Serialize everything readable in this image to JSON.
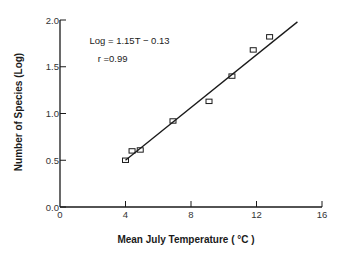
{
  "chart_data": {
    "type": "scatter",
    "title": "",
    "xlabel": "Mean July Temperature ( °C )",
    "ylabel": "Number of Species (Log)",
    "xlim": [
      0,
      16
    ],
    "ylim": [
      0.0,
      2.0
    ],
    "x_ticks": [
      0,
      4,
      8,
      12,
      16
    ],
    "x_tick_labels": [
      "0",
      "4",
      "8",
      "12",
      "16"
    ],
    "y_ticks": [
      0.0,
      0.5,
      1.0,
      1.5,
      2.0
    ],
    "y_tick_labels": [
      "0.0",
      "0.5",
      "1.0",
      "1.5",
      "2.0"
    ],
    "grid": false,
    "legend": null,
    "series": [
      {
        "name": "observations",
        "marker": "open-square",
        "points": [
          {
            "x": 4.0,
            "y": 0.5
          },
          {
            "x": 4.4,
            "y": 0.6
          },
          {
            "x": 4.9,
            "y": 0.61
          },
          {
            "x": 6.9,
            "y": 0.92
          },
          {
            "x": 9.1,
            "y": 1.13
          },
          {
            "x": 10.5,
            "y": 1.4
          },
          {
            "x": 11.8,
            "y": 1.68
          },
          {
            "x": 12.8,
            "y": 1.82
          }
        ]
      },
      {
        "name": "regression line",
        "type": "line",
        "points": [
          {
            "x": 4.0,
            "y": 0.5
          },
          {
            "x": 14.5,
            "y": 1.98
          }
        ]
      }
    ],
    "annotations": [
      {
        "text": "Log = 1.15T − 0.13",
        "x": 1.8,
        "y": 1.74
      },
      {
        "text": "r =0.99",
        "x": 2.3,
        "y": 1.55
      }
    ]
  },
  "colors": {
    "ink": "#1a1a1a",
    "background": "#ffffff"
  }
}
